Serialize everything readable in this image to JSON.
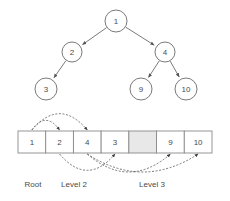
{
  "figure": {
    "type": "binary-tree-to-array-mapping-diagram",
    "background_color": "#ffffff",
    "stroke_color": "#6b6b6b",
    "shaded_cell_color": "#e8e8e8",
    "text_color": "#4a4a4a"
  },
  "tree": {
    "nodes": [
      {
        "id": "root",
        "label": "1",
        "cx": 116,
        "cy": 21,
        "r": 11
      },
      {
        "id": "n2",
        "label": "2",
        "cx": 72,
        "cy": 52,
        "r": 10
      },
      {
        "id": "n4",
        "label": "4",
        "cx": 165,
        "cy": 52,
        "r": 10
      },
      {
        "id": "n3",
        "label": "3",
        "cx": 46,
        "cy": 89,
        "r": 11
      },
      {
        "id": "n9",
        "label": "9",
        "cx": 141,
        "cy": 89,
        "r": 11
      },
      {
        "id": "n10",
        "label": "10",
        "cx": 186,
        "cy": 89,
        "r": 11
      }
    ],
    "edges": [
      {
        "from": "root",
        "to": "n2",
        "arrowhead": true
      },
      {
        "from": "root",
        "to": "n4",
        "arrowhead": true
      },
      {
        "from": "n2",
        "to": "n3",
        "arrowhead": true
      },
      {
        "from": "n4",
        "to": "n9",
        "arrowhead": true
      },
      {
        "from": "n4",
        "to": "n10",
        "arrowhead": true
      }
    ]
  },
  "array": {
    "x": 18,
    "y": 131,
    "width": 194,
    "height": 22,
    "cell_count": 7,
    "cells": [
      {
        "index": 0,
        "value": "1",
        "shaded": false
      },
      {
        "index": 1,
        "value": "2",
        "shaded": false
      },
      {
        "index": 2,
        "value": "4",
        "shaded": false
      },
      {
        "index": 3,
        "value": "3",
        "shaded": false
      },
      {
        "index": 4,
        "value": "",
        "shaded": true
      },
      {
        "index": 5,
        "value": "9",
        "shaded": false
      },
      {
        "index": 6,
        "value": "10",
        "shaded": false
      }
    ]
  },
  "pointer_arcs": {
    "above": [
      {
        "id": "arc-1-to-2",
        "from_cell": 0,
        "to_cell": 1,
        "side": "above"
      },
      {
        "id": "arc-1-to-4",
        "from_cell": 0,
        "to_cell": 2,
        "side": "above"
      }
    ],
    "below": [
      {
        "id": "arc-2-to-3",
        "from_cell": 1,
        "to_cell": 3,
        "side": "below"
      },
      {
        "id": "arc-4-to-9",
        "from_cell": 2,
        "to_cell": 5,
        "side": "below"
      },
      {
        "id": "arc-4-to-10",
        "from_cell": 2,
        "to_cell": 6,
        "side": "below"
      }
    ]
  },
  "captions": [
    {
      "id": "caption-root",
      "text": "Root",
      "x": 33,
      "y": 184
    },
    {
      "id": "caption-level-2",
      "text": "Level 2",
      "x": 74,
      "y": 184
    },
    {
      "id": "caption-level-3",
      "text": "Level 3",
      "x": 152,
      "y": 184
    }
  ]
}
